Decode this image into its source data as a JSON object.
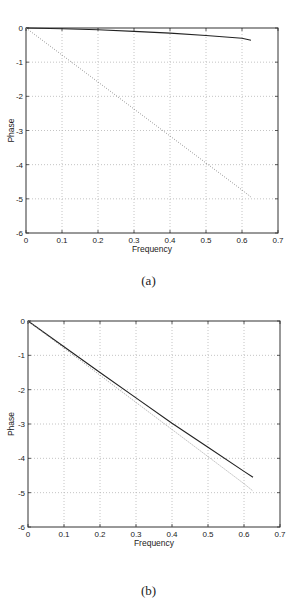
{
  "chart_data": [
    {
      "type": "line",
      "panel": "a",
      "caption": "(a)",
      "xlabel": "Frequency",
      "ylabel": "Phase",
      "xlim": [
        0,
        0.7
      ],
      "ylim": [
        -6,
        0
      ],
      "xticks": [
        "0",
        "0.1",
        "0.2",
        "0.3",
        "0.4",
        "0.5",
        "0.6",
        "0.7"
      ],
      "yticks": [
        "0",
        "-1",
        "-2",
        "-3",
        "-4",
        "-5",
        "-6"
      ],
      "grid": true,
      "series": [
        {
          "name": "solid",
          "style": "solid",
          "color": "#222222",
          "x": [
            0,
            0.1,
            0.2,
            0.3,
            0.4,
            0.5,
            0.6,
            0.625
          ],
          "y": [
            0,
            -0.02,
            -0.05,
            -0.1,
            -0.15,
            -0.22,
            -0.3,
            -0.36
          ]
        },
        {
          "name": "dotted",
          "style": "dotted",
          "color": "#888888",
          "x": [
            0,
            0.1,
            0.2,
            0.3,
            0.4,
            0.5,
            0.6,
            0.625
          ],
          "y": [
            0,
            -0.79,
            -1.58,
            -2.37,
            -3.16,
            -3.95,
            -4.74,
            -4.95
          ]
        }
      ]
    },
    {
      "type": "line",
      "panel": "b",
      "caption": "(b)",
      "xlabel": "Frequency",
      "ylabel": "Phase",
      "xlim": [
        0,
        0.7
      ],
      "ylim": [
        -6,
        0
      ],
      "xticks": [
        "0",
        "0.1",
        "0.2",
        "0.3",
        "0.4",
        "0.5",
        "0.6",
        "0.7"
      ],
      "yticks": [
        "0",
        "-1",
        "-2",
        "-3",
        "-4",
        "-5",
        "-6"
      ],
      "grid": true,
      "series": [
        {
          "name": "solid",
          "style": "solid",
          "color": "#222222",
          "x": [
            0,
            0.1,
            0.2,
            0.3,
            0.4,
            0.5,
            0.6,
            0.625
          ],
          "y": [
            0,
            -0.75,
            -1.5,
            -2.24,
            -2.98,
            -3.68,
            -4.38,
            -4.55
          ]
        },
        {
          "name": "dotted",
          "style": "dotted",
          "color": "#888888",
          "x": [
            0,
            0.1,
            0.2,
            0.3,
            0.4,
            0.5,
            0.6,
            0.625
          ],
          "y": [
            0,
            -0.79,
            -1.58,
            -2.37,
            -3.16,
            -3.95,
            -4.74,
            -4.95
          ]
        }
      ]
    }
  ],
  "figure": {
    "panels": [
      {
        "caption": "(a)",
        "xlabel": "Frequency",
        "ylabel": "Phase"
      },
      {
        "caption": "(b)",
        "xlabel": "Frequency",
        "ylabel": "Phase"
      }
    ]
  }
}
